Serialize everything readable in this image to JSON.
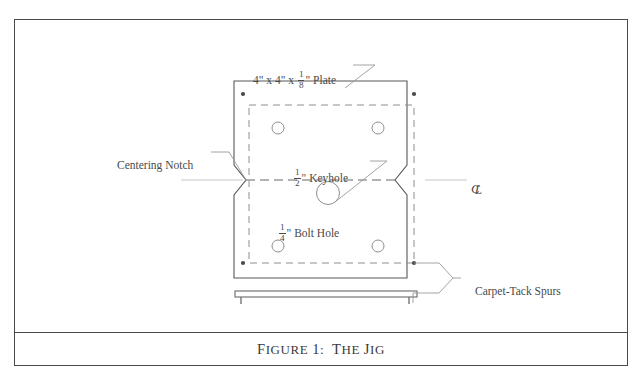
{
  "figure": {
    "caption_prefix": "Figure",
    "caption_number": "1:",
    "caption_title": "The Jig",
    "caption_full": "Figure 1:  The Jig"
  },
  "labels": {
    "plate": {
      "pre": "4\" x 4\" x ",
      "frac_num": "1",
      "frac_den": "8",
      "post": "\" Plate"
    },
    "centering_notch": "Centering Notch",
    "keyhole": {
      "frac_num": "1",
      "frac_den": "2",
      "post": "\" Keyhole"
    },
    "bolt_hole": {
      "frac_num": "1",
      "frac_den": "4",
      "post": "\" Bolt Hole"
    },
    "carpet_tack_spurs": "Carpet-Tack Spurs",
    "centerline": {
      "c": "C",
      "l": "L"
    }
  },
  "colors": {
    "ink": "#4a4a4a",
    "frame": "#4a4a4a",
    "light_ink": "#8a8a8a",
    "very_light_ink": "#b4b4b4",
    "spur_dot": "#3a3a3a",
    "background": "#ffffff"
  },
  "geometry": {
    "plate": {
      "left": 233,
      "right": 406,
      "top": 75,
      "bottom": 272,
      "notch_mid_y": 174,
      "notch_depth": 12,
      "notch_half_height": 15
    },
    "dashed_inner_rect": {
      "left": 248,
      "right": 413,
      "top": 99,
      "bottom": 257
    },
    "bolt_holes": [
      {
        "cx": 277,
        "cy": 122,
        "r": 6
      },
      {
        "cx": 377,
        "cy": 122,
        "r": 6
      },
      {
        "cx": 277,
        "cy": 240,
        "r": 6
      },
      {
        "cx": 377,
        "cy": 240,
        "r": 6
      }
    ],
    "keyhole": {
      "cx": 327,
      "cy": 187,
      "r": 11
    },
    "spur_dots": [
      {
        "cx": 242,
        "cy": 88
      },
      {
        "cx": 413,
        "cy": 88
      },
      {
        "cx": 242,
        "cy": 257
      },
      {
        "cx": 413,
        "cy": 257
      }
    ],
    "side_view_bar": {
      "left": 234,
      "right": 416,
      "top": 285,
      "bottom": 291
    },
    "side_view_prongs": [
      {
        "x": 240,
        "y1": 291,
        "y2": 297
      },
      {
        "x": 408,
        "y1": 291,
        "y2": 297
      }
    ],
    "centerline_y": 174
  }
}
